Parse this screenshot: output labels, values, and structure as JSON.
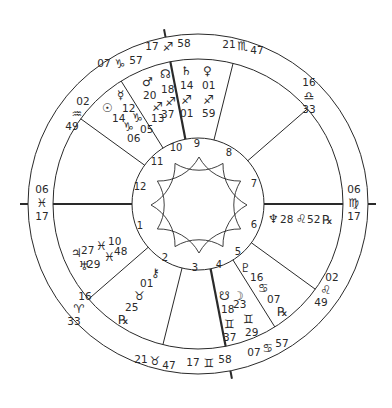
{
  "chart_type": "Natal astrology wheel",
  "geometry": {
    "center": [
      198,
      204
    ],
    "outer_radius": 170,
    "sign_ring_radius": 145,
    "inner_radius": 66,
    "axis_tick_radius": 178,
    "star_tip_radius": 48,
    "star_valley_radius": 24
  },
  "colors": {
    "line": "#2a2a2a",
    "background": "#ffffff"
  },
  "angles": {
    "ascendant": {
      "deg": "06",
      "sign": "♓",
      "min": "17"
    },
    "descendant": {
      "deg": "06",
      "sign": "♍",
      "min": "17"
    },
    "midheaven": {
      "deg": "17",
      "sign": "♐",
      "min": "58"
    },
    "imum_coeli": {
      "deg": "17",
      "sign": "♊",
      "min": "58"
    }
  },
  "cusps": [
    {
      "house": 1,
      "angle": 180,
      "deg": "06",
      "sign": "♓",
      "min": "17",
      "thick": true
    },
    {
      "house": 2,
      "angle": 221,
      "deg": "16",
      "sign": "♈",
      "min": "33",
      "thick": false
    },
    {
      "house": 3,
      "angle": 256,
      "deg": "21",
      "sign": "♉",
      "min": "47",
      "thick": false
    },
    {
      "house": 4,
      "angle": 281,
      "deg": "17",
      "sign": "♊",
      "min": "58",
      "thick": true
    },
    {
      "house": 5,
      "angle": 302,
      "deg": "07",
      "sign": "♋",
      "min": "57",
      "thick": false
    },
    {
      "house": 6,
      "angle": 324,
      "deg": "02",
      "sign": "♌",
      "min": "49",
      "thick": false
    },
    {
      "house": 7,
      "angle": 0,
      "deg": "06",
      "sign": "♍",
      "min": "17",
      "thick": true
    },
    {
      "house": 8,
      "angle": 41,
      "deg": "16",
      "sign": "♎",
      "min": "33",
      "thick": false
    },
    {
      "house": 9,
      "angle": 76,
      "deg": "21",
      "sign": "♏",
      "min": "47",
      "thick": false
    },
    {
      "house": 10,
      "angle": 101,
      "deg": "17",
      "sign": "♐",
      "min": "58",
      "thick": true
    },
    {
      "house": 11,
      "angle": 122,
      "deg": "07",
      "sign": "♑",
      "min": "57",
      "thick": false
    },
    {
      "house": 12,
      "angle": 144,
      "deg": "02",
      "sign": "♒",
      "min": "49",
      "thick": false
    }
  ],
  "cusp_labels": [
    {
      "id": "cusp-11",
      "x": 120,
      "y": 67,
      "deg": "07",
      "sign": "♑",
      "min": "57",
      "layout": "inline"
    },
    {
      "id": "cusp-10",
      "x": 168,
      "y": 50,
      "deg": "17",
      "sign": "♐",
      "min": "58",
      "layout": "inline"
    },
    {
      "id": "cusp-9",
      "x": 243,
      "y": 48,
      "deg": "21",
      "sign": "♏",
      "min": "47",
      "layout": "inline-sub"
    },
    {
      "id": "cusp-8",
      "x": 309,
      "y": 98,
      "deg": "16",
      "sign": "♎",
      "min": "33",
      "layout": "stack"
    },
    {
      "id": "cusp-7",
      "x": 354,
      "y": 205,
      "deg": "06",
      "sign": "♍",
      "min": "17",
      "layout": "stack"
    },
    {
      "id": "cusp-6",
      "x": 326,
      "y": 293,
      "deg": "02",
      "sign": "♌",
      "min": "49",
      "layout": "stack-diag"
    },
    {
      "id": "cusp-5",
      "x": 268,
      "y": 350,
      "deg": "07",
      "sign": "♋",
      "min": "57",
      "layout": "inline-sup"
    },
    {
      "id": "cusp-4",
      "x": 209,
      "y": 366,
      "deg": "17",
      "sign": "♊",
      "min": "58",
      "layout": "inline"
    },
    {
      "id": "cusp-3",
      "x": 155,
      "y": 363,
      "deg": "21",
      "sign": "♉",
      "min": "47",
      "layout": "inline-sub"
    },
    {
      "id": "cusp-2",
      "x": 79,
      "y": 312,
      "deg": "16",
      "sign": "♈",
      "min": "33",
      "layout": "stack-diag"
    },
    {
      "id": "cusp-1",
      "x": 42,
      "y": 205,
      "deg": "06",
      "sign": "♓",
      "min": "17",
      "layout": "stack"
    },
    {
      "id": "cusp-12",
      "x": 77,
      "y": 117,
      "deg": "02",
      "sign": "♒",
      "min": "49",
      "layout": "stack-diag"
    }
  ],
  "house_numbers": [
    {
      "n": "1",
      "x": 140,
      "y": 229
    },
    {
      "n": "2",
      "x": 165,
      "y": 261
    },
    {
      "n": "3",
      "x": 195,
      "y": 271
    },
    {
      "n": "4",
      "x": 219,
      "y": 268
    },
    {
      "n": "5",
      "x": 238,
      "y": 255
    },
    {
      "n": "6",
      "x": 254,
      "y": 228
    },
    {
      "n": "7",
      "x": 254,
      "y": 187
    },
    {
      "n": "8",
      "x": 229,
      "y": 156
    },
    {
      "n": "9",
      "x": 197,
      "y": 147
    },
    {
      "n": "10",
      "x": 176,
      "y": 151
    },
    {
      "n": "11",
      "x": 157,
      "y": 165
    },
    {
      "n": "12",
      "x": 140,
      "y": 190
    }
  ],
  "planets": [
    {
      "name": "Sun",
      "glyph": "☉",
      "deg": "14",
      "sign": "♑",
      "min": "06",
      "retrograde": false
    },
    {
      "name": "Mercury",
      "glyph": "☿",
      "deg": "12",
      "sign": "♑",
      "min": "05",
      "retrograde": false
    },
    {
      "name": "Mars",
      "glyph": "♂",
      "deg": "20",
      "sign": "♐",
      "min": "13",
      "retrograde": false
    },
    {
      "name": "North Node",
      "glyph": "☊",
      "deg": "18",
      "sign": "♐",
      "min": "37",
      "retrograde": false,
      "note": "drawn as south-node-like glyph at top"
    },
    {
      "name": "Saturn",
      "glyph": "♄",
      "deg": "14",
      "sign": "♐",
      "min": "01",
      "retrograde": false
    },
    {
      "name": "Venus",
      "glyph": "♀",
      "deg": "01",
      "sign": "♐",
      "min": "59",
      "retrograde": false
    },
    {
      "name": "Neptune",
      "glyph": "♆",
      "deg": "28",
      "sign": "♌",
      "min": "52",
      "retrograde": true
    },
    {
      "name": "Pluto",
      "glyph": "♇",
      "deg": "16",
      "sign": "♋",
      "min": "07",
      "retrograde": true
    },
    {
      "name": "South Node",
      "glyph": "☋",
      "deg": "18",
      "sign": "♊",
      "min": "37",
      "retrograde": false
    },
    {
      "name": "Moon",
      "glyph": "☽",
      "deg": "23",
      "sign": "♊",
      "min": "29",
      "retrograde": false
    },
    {
      "name": "Chiron",
      "glyph": "⚷",
      "deg": "01",
      "sign": "♉",
      "min": "25",
      "retrograde": true
    },
    {
      "name": "Jupiter",
      "glyph": "♃",
      "deg": "27",
      "sign": "♓",
      "min": "10",
      "retrograde": false
    },
    {
      "name": "Uranus",
      "glyph": "♅",
      "deg": "29",
      "sign": "♓",
      "min": "48",
      "retrograde": false
    }
  ],
  "retrograde_symbol": "℞"
}
